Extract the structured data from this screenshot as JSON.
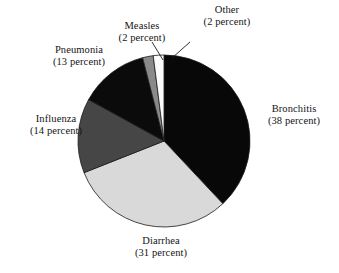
{
  "chart_data": {
    "type": "pie",
    "title": "",
    "unit": "percent",
    "legend_position": "outside-labels",
    "grid": false,
    "categories": [
      "Bronchitis",
      "Diarrhea",
      "Influenza",
      "Pneumonia",
      "Measles",
      "Other"
    ],
    "values": [
      38,
      31,
      14,
      13,
      2,
      2
    ],
    "start_angle_deg": 0,
    "direction": "clockwise",
    "slices": [
      {
        "name": "Bronchitis",
        "value": 38,
        "percent_text": "(38 percent)",
        "color": "#080808",
        "start_deg": 0,
        "end_deg": 136.8
      },
      {
        "name": "Diarrhea",
        "value": 31,
        "percent_text": "(31 percent)",
        "color": "#d9d9d9",
        "start_deg": 136.8,
        "end_deg": 248.4
      },
      {
        "name": "Influenza",
        "value": 14,
        "percent_text": "(14 percent)",
        "color": "#464646",
        "start_deg": 248.4,
        "end_deg": 298.8
      },
      {
        "name": "Pneumonia",
        "value": 13,
        "percent_text": "(13 percent)",
        "color": "#0b0b0b",
        "start_deg": 298.8,
        "end_deg": 345.6
      },
      {
        "name": "Measles",
        "value": 2,
        "percent_text": "(2 percent)",
        "color": "#8a8a8a",
        "start_deg": 345.6,
        "end_deg": 352.8
      },
      {
        "name": "Other",
        "value": 2,
        "percent_text": "(2 percent)",
        "color": "#fbfbfb",
        "start_deg": 352.8,
        "end_deg": 360.0
      }
    ]
  },
  "labels": {
    "bronchitis": {
      "name": "Bronchitis",
      "pct": "(38 percent)"
    },
    "diarrhea": {
      "name": "Diarrhea",
      "pct": "(31 percent)"
    },
    "influenza": {
      "name": "Influenza",
      "pct": "(14 percent)"
    },
    "pneumonia": {
      "name": "Pneumonia",
      "pct": "(13 percent)"
    },
    "measles": {
      "name": "Measles",
      "pct": "(2 percent)"
    },
    "other": {
      "name": "Other",
      "pct": "(2 percent)"
    }
  },
  "geometry": {
    "center_x": 164,
    "center_y": 141,
    "radius": 86
  },
  "colors": {
    "background": "#ffffff",
    "outline": "#1a1a1a",
    "text": "#141414"
  }
}
